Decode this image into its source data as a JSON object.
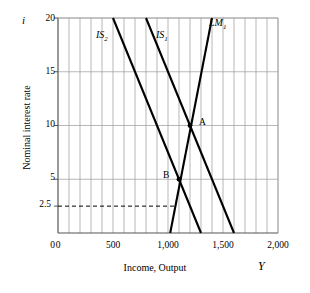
{
  "chart_data": {
    "type": "line",
    "title": "",
    "xlabel": "Income, Output",
    "ylabel": "Nominal interest rate",
    "x_symbol": "Y",
    "y_symbol": "i",
    "xlim": [
      0,
      2000
    ],
    "ylim": [
      0,
      20
    ],
    "grid": true,
    "grid_x_step": 100,
    "y_tick_labels": [
      "20",
      "15",
      "10",
      "5",
      "2.5",
      "0"
    ],
    "y_tick_values": [
      20,
      15,
      10,
      5,
      2.5,
      0
    ],
    "x_tick_labels": [
      "0",
      "500",
      "1,000",
      "1,500",
      "2,000"
    ],
    "x_tick_values": [
      0,
      500,
      1000,
      1500,
      2000
    ],
    "legend_position": "inline-curve-labels",
    "series": [
      {
        "name": "IS_2",
        "label": "IS",
        "subscript": "2",
        "color": "#000000",
        "x": [
          500,
          1300
        ],
        "y": [
          20,
          0
        ]
      },
      {
        "name": "IS_1",
        "label": "IS",
        "subscript": "1",
        "color": "#000000",
        "x": [
          800,
          1600
        ],
        "y": [
          20,
          0
        ]
      },
      {
        "name": "LM_1",
        "label": "LM",
        "subscript": "1",
        "color": "#000000",
        "x": [
          1020,
          1400
        ],
        "y": [
          0,
          20
        ]
      }
    ],
    "annotations": [
      {
        "name": "point-a",
        "label": "A",
        "x": 1200,
        "y": 10,
        "marker": "dot"
      },
      {
        "name": "point-b",
        "label": "B",
        "x": 1100,
        "y": 5,
        "marker": "dot"
      },
      {
        "name": "dashed-reference-line",
        "label": "",
        "y": 2.5,
        "x_start": 0,
        "x_end": 1068,
        "style": "dashed"
      }
    ]
  },
  "labels": {
    "y_axis_title": "Nominal interest rate",
    "x_axis_title": "Income, Output",
    "y_symbol": "i",
    "x_symbol": "Y",
    "tick_y_20": "20",
    "tick_y_15": "15",
    "tick_y_10": "10",
    "tick_y_5": "5",
    "tick_y_2_5": "2.5",
    "tick_y_0": "0",
    "tick_x_0": "0",
    "tick_x_500": "500",
    "tick_x_1000": "1,000",
    "tick_x_1500": "1,500",
    "tick_x_2000": "2,000",
    "curve_is2_base": "IS",
    "curve_is2_sub": "2",
    "curve_is1_base": "IS",
    "curve_is1_sub": "1",
    "curve_lm1_base": "LM",
    "curve_lm1_sub": "1",
    "point_a": "A",
    "point_b": "B"
  },
  "colors": {
    "curve": "#000000",
    "grid": "#9a9a9a",
    "axis": "#555555",
    "background": "#ffffff"
  }
}
